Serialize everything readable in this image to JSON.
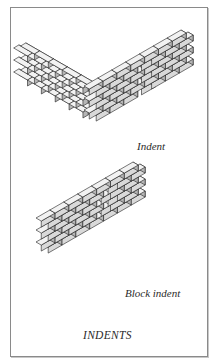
{
  "figure": {
    "title": "INDENTS",
    "captions": {
      "indent": "Indent",
      "block_indent": "Block indent"
    },
    "colors": {
      "brick_top": "#f2f2f2",
      "brick_front": "#d9d9d9",
      "brick_side": "#b5b5b5",
      "stroke": "#1e1e1e",
      "border": "#8a8a8a"
    },
    "walls": [
      {
        "name": "indent-corner-wall",
        "courses": 6,
        "left_wing": {
          "origin": [
            85,
            148
          ],
          "bricks": 4,
          "direction": "up-left"
        },
        "right_wing": {
          "origin": [
            85,
            148
          ],
          "bricks": 6,
          "direction": "up-right"
        },
        "indent_on": "alternate-courses"
      },
      {
        "name": "block-indent-wall",
        "courses": 6,
        "origin": [
          50,
          252
        ],
        "bricks": 6,
        "direction": "up-right",
        "block_indent_column": 3
      }
    ]
  }
}
